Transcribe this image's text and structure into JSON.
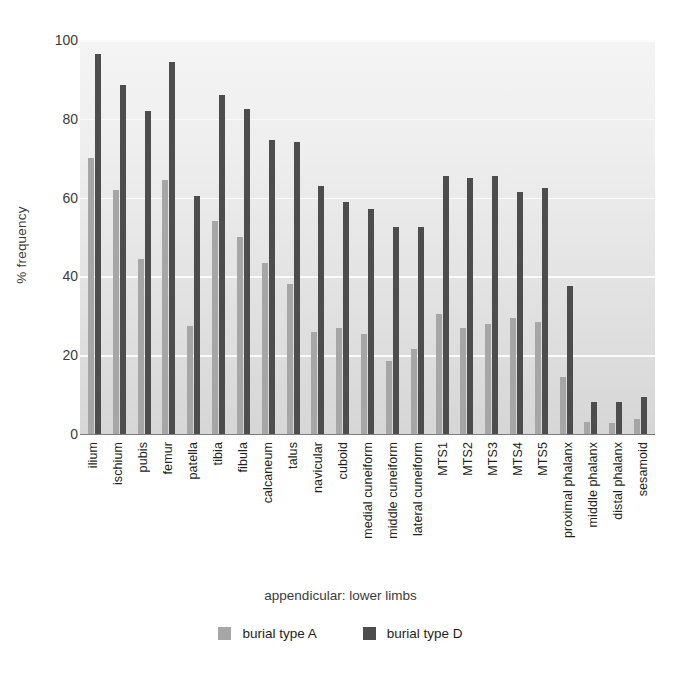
{
  "chart_data": {
    "type": "bar",
    "title": "",
    "xlabel": "appendicular: lower limbs",
    "ylabel": "% frequency",
    "ylim": [
      0,
      100
    ],
    "yticks": [
      0,
      20,
      40,
      60,
      80,
      100
    ],
    "grid": true,
    "legend_position": "bottom",
    "categories": [
      "ilium",
      "ischium",
      "pubis",
      "femur",
      "patella",
      "tibia",
      "fibula",
      "calcaneum",
      "talus",
      "navicular",
      "cuboid",
      "medial cuneiform",
      "middle cuneiform",
      "lateral cuneiform",
      "MTS1",
      "MTS2",
      "MTS3",
      "MTS4",
      "MTS5",
      "proximal phalanx",
      "middle phalanx",
      "distal phalanx",
      "sesamoid"
    ],
    "series": [
      {
        "name": "burial type A",
        "color": "#a6a6a6",
        "values": [
          70,
          62,
          44.5,
          64.5,
          27.5,
          54,
          50,
          43.5,
          38,
          26,
          27,
          25.5,
          18.5,
          21.5,
          30.5,
          27,
          28,
          29.5,
          28.5,
          14.5,
          3,
          2.8,
          3.8
        ]
      },
      {
        "name": "burial type D",
        "color": "#4d4d4d",
        "values": [
          96.5,
          88.5,
          82,
          94.5,
          60.5,
          86,
          82.5,
          74.5,
          74,
          63,
          59,
          57,
          52.5,
          52.5,
          65.5,
          65,
          65.5,
          61.5,
          62.5,
          37.5,
          8,
          8,
          9.5
        ]
      }
    ]
  },
  "axes": {
    "y_title": "% frequency",
    "x_title": "appendicular: lower limbs"
  },
  "legend": {
    "items": [
      {
        "label": "burial type A",
        "color": "#a6a6a6"
      },
      {
        "label": "burial type D",
        "color": "#4d4d4d"
      }
    ]
  }
}
